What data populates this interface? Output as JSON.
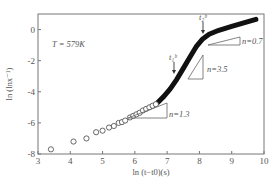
{
  "chart_data": {
    "type": "scatter",
    "title": "",
    "xlabel": "ln (t−t0)(s)",
    "ylabel": "ln (lnx⁻¹)",
    "xlim": [
      3,
      10
    ],
    "ylim": [
      -8,
      1
    ],
    "x_ticks": [
      "3",
      "4",
      "5",
      "6",
      "7",
      "8",
      "9",
      "10"
    ],
    "y_ticks": [
      "0",
      "-2",
      "-4",
      "-6",
      "-8"
    ],
    "grid": false,
    "legend": null,
    "annotations": {
      "temperature": "T = 579K",
      "arrow_1": "t₁ᵇ",
      "arrow_2": "t₂ᵇ",
      "slope_1": "n=1.3",
      "slope_2": "n=3.5",
      "slope_3": "n=0.7"
    },
    "series": [
      {
        "name": "open-circles",
        "marker": "circle-open",
        "x": [
          3.4,
          4.1,
          4.5,
          4.8,
          5.0,
          5.2,
          5.35,
          5.5,
          5.6,
          5.7,
          5.85,
          5.95,
          6.05,
          6.15,
          6.25,
          6.35,
          6.45,
          6.55,
          6.65
        ],
        "y": [
          -7.7,
          -7.2,
          -7.0,
          -6.6,
          -6.5,
          -6.3,
          -6.2,
          -6.0,
          -5.95,
          -5.85,
          -5.65,
          -5.55,
          -5.45,
          -5.35,
          -5.2,
          -5.1,
          -5.0,
          -4.9,
          -4.8
        ]
      },
      {
        "name": "dense-curve",
        "marker": "line-thick",
        "x": [
          6.7,
          6.9,
          7.1,
          7.3,
          7.5,
          7.7,
          7.9,
          8.1,
          8.3,
          8.6,
          9.0,
          9.4,
          9.75
        ],
        "y": [
          -4.7,
          -4.3,
          -3.8,
          -3.2,
          -2.5,
          -1.8,
          -1.1,
          -0.6,
          -0.3,
          -0.05,
          0.2,
          0.45,
          0.65
        ]
      }
    ]
  }
}
